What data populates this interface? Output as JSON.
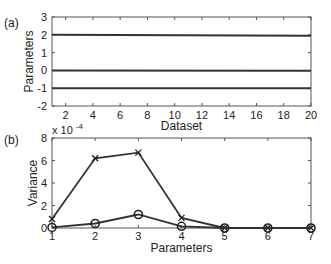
{
  "chart_data": [
    {
      "panel": "(a)",
      "type": "line",
      "title": "",
      "xlabel": "Dataset",
      "ylabel": "Parameters",
      "xlim": [
        1,
        20
      ],
      "ylim": [
        -2,
        3
      ],
      "xticks": [
        "2",
        "4",
        "6",
        "8",
        "10",
        "12",
        "14",
        "16",
        "18",
        "20"
      ],
      "yticks": [
        "-2",
        "-1",
        "0",
        "1",
        "2",
        "3"
      ],
      "grid": false,
      "series": [
        {
          "name": "line1",
          "x": [
            1,
            20
          ],
          "values": [
            2,
            1.95
          ]
        },
        {
          "name": "line2",
          "x": [
            1,
            20
          ],
          "values": [
            0,
            -0.02
          ]
        },
        {
          "name": "line3",
          "x": [
            1,
            20
          ],
          "values": [
            -1,
            -1
          ]
        }
      ]
    },
    {
      "panel": "(b)",
      "type": "line",
      "title": "",
      "xlabel": "Parameters",
      "ylabel": "Variance",
      "scale_label": "x 10",
      "scale_exponent": "-4",
      "categories": [
        "1",
        "2",
        "3",
        "4",
        "5",
        "6",
        "7"
      ],
      "xlim": [
        1,
        7
      ],
      "ylim": [
        0,
        8
      ],
      "yticks": [
        "0",
        "2",
        "4",
        "6",
        "8"
      ],
      "grid": false,
      "series": [
        {
          "name": "x-marker",
          "marker": "x",
          "values": [
            0.8,
            6.2,
            6.7,
            0.9,
            0,
            0,
            0
          ]
        },
        {
          "name": "o-marker",
          "marker": "o",
          "values": [
            0.05,
            0.4,
            1.2,
            0.15,
            0,
            0,
            0
          ]
        }
      ]
    }
  ],
  "labels": {
    "panel_a": "(a)",
    "panel_b": "(b)"
  }
}
